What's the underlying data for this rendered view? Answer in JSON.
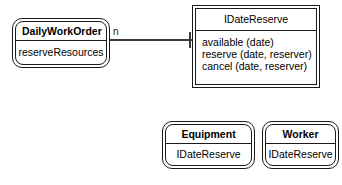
{
  "diagram": {
    "type": "uml-class-diagram",
    "background_color": "#ffffff",
    "line_color": "#1a1a1a",
    "text_color": "#000000"
  },
  "daily_work_order": {
    "title": "DailyWorkOrder",
    "operations": [
      "reserveResources"
    ]
  },
  "association": {
    "multiplicity_label": "n"
  },
  "date_reserve_interface": {
    "title": "IDateReserve",
    "operations": [
      "available (date)",
      "reserve (date, reserver)",
      "cancel (date, reserver)"
    ]
  },
  "equipment": {
    "title": "Equipment",
    "operations": [
      "IDateReserve"
    ]
  },
  "worker": {
    "title": "Worker",
    "operations": [
      "IDateReserve"
    ]
  }
}
